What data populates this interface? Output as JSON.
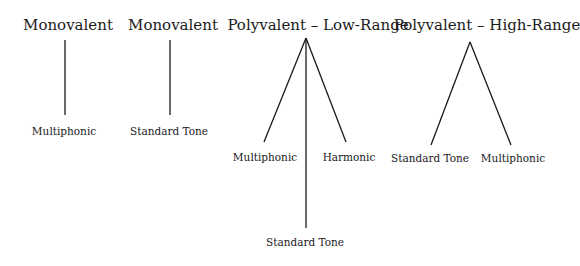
{
  "diagram": {
    "groups": [
      {
        "title": "Monovalent",
        "children": [
          "Multiphonic"
        ]
      },
      {
        "title": "Monovalent",
        "children": [
          "Standard Tone"
        ]
      },
      {
        "title": "Polyvalent – Low-Range",
        "children": [
          "Multiphonic",
          "Harmonic",
          "Standard Tone"
        ]
      },
      {
        "title": "Polyvalent – High-Range",
        "children": [
          "Standard Tone",
          "Multiphonic"
        ]
      }
    ],
    "line_color": "#1a1a1a"
  }
}
